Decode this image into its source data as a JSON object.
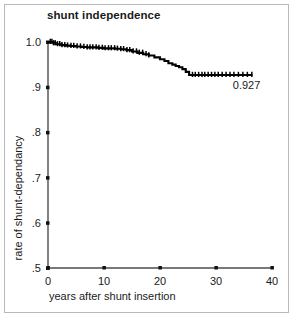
{
  "figure": {
    "title": "shunt independence",
    "xlabel": "years after shunt insertion",
    "ylabel": "rate of shunt-dependancy",
    "endpoint_label": "0.927",
    "border_color": "#b9b9b9",
    "curve_color": "#000000",
    "background": "#ffffff"
  },
  "axes": {
    "x_ticks": [
      "0",
      "10",
      "20",
      "30",
      "40"
    ],
    "y_ticks": [
      "1.0",
      ".9",
      ".8",
      ".7",
      ".6",
      ".5"
    ]
  },
  "chart_data": {
    "type": "line",
    "title": "shunt independence",
    "subtitle": "",
    "xlabel": "years after shunt insertion",
    "ylabel": "rate of shunt-dependancy",
    "xlim": [
      0,
      40
    ],
    "ylim": [
      0.5,
      1.0
    ],
    "xticks": [
      0,
      10,
      20,
      30,
      40
    ],
    "yticks": [
      0.5,
      0.6,
      0.7,
      0.8,
      0.9,
      1.0
    ],
    "xtick_labels": [
      "0",
      "10",
      "20",
      "30",
      "40"
    ],
    "ytick_labels": [
      ".5",
      ".6",
      ".7",
      ".8",
      ".9",
      "1.0"
    ],
    "grid": false,
    "legend": null,
    "curve_style": "kaplan-meier-step",
    "annotations": [
      {
        "text": "0.927",
        "x": 33.0,
        "y": 0.905,
        "describes": "final plateau survival estimate"
      }
    ],
    "series": [
      {
        "name": "shunt independence",
        "type": "step",
        "color": "#000000",
        "x": [
          0.0,
          0.3,
          1.0,
          1.6,
          2.4,
          3.2,
          4.0,
          5.0,
          6.0,
          7.0,
          8.0,
          9.0,
          10.0,
          11.0,
          12.0,
          13.0,
          14.0,
          15.0,
          16.0,
          17.0,
          18.0,
          19.0,
          20.0,
          20.8,
          21.5,
          22.2,
          22.8,
          23.4,
          24.0,
          24.6,
          25.2,
          36.5
        ],
        "y": [
          1.0,
          1.0,
          0.997,
          0.995,
          0.993,
          0.992,
          0.991,
          0.99,
          0.989,
          0.988,
          0.988,
          0.987,
          0.986,
          0.986,
          0.985,
          0.984,
          0.982,
          0.979,
          0.976,
          0.973,
          0.97,
          0.966,
          0.962,
          0.958,
          0.953,
          0.95,
          0.947,
          0.944,
          0.94,
          0.934,
          0.927,
          0.927
        ]
      }
    ],
    "censor_marks_x": [
      0.4,
      0.7,
      1.0,
      1.3,
      1.7,
      2.1,
      2.5,
      3.0,
      3.5,
      4.1,
      4.6,
      5.2,
      5.8,
      6.4,
      7.0,
      7.5,
      8.0,
      8.6,
      9.1,
      9.7,
      10.2,
      10.8,
      11.3,
      11.9,
      12.4,
      13.0,
      13.5,
      14.1,
      14.6,
      15.2,
      15.8,
      16.3,
      16.9,
      17.5,
      18.0,
      25.8,
      26.3,
      26.9,
      27.5,
      28.0,
      28.6,
      29.2,
      29.8,
      30.4,
      31.1,
      31.8,
      32.5,
      33.2,
      34.0,
      34.8,
      35.6,
      36.4
    ]
  }
}
